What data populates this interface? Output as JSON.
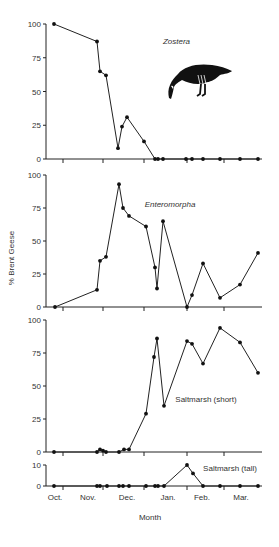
{
  "chart_data": [
    {
      "type": "line",
      "title": "Zostera",
      "title_italic": true,
      "ylabel": "% Brent Geese",
      "ylim": [
        0,
        100
      ],
      "yticks": [
        0,
        25,
        50,
        75,
        100
      ],
      "x_month_positions": [
        54,
        97,
        100,
        106,
        118,
        122,
        127,
        144,
        155,
        158,
        163,
        186,
        192,
        203,
        220,
        240,
        258
      ],
      "values": [
        100,
        87,
        65,
        62,
        8,
        24,
        31,
        13,
        0,
        0,
        0,
        0,
        0,
        0,
        0,
        0,
        0
      ]
    },
    {
      "type": "line",
      "title": "Enteromorpha",
      "title_italic": true,
      "ylim": [
        0,
        100
      ],
      "yticks": [
        0,
        25,
        50,
        75,
        100
      ],
      "x_month_positions": [
        55,
        97,
        100,
        106,
        119,
        123,
        129,
        146,
        155,
        157,
        163,
        187,
        192,
        203,
        220,
        240,
        258
      ],
      "values": [
        0,
        13,
        35,
        38,
        93,
        75,
        69,
        61,
        30,
        14,
        65,
        0,
        9,
        33,
        7,
        17,
        41
      ]
    },
    {
      "type": "line",
      "title": "Saltmarsh (short)",
      "title_italic": false,
      "ylim": [
        0,
        100
      ],
      "yticks": [
        0,
        25,
        50,
        75,
        100
      ],
      "x_month_positions": [
        54,
        97,
        100,
        103,
        106,
        119,
        124,
        129,
        146,
        154,
        157,
        164,
        187,
        192,
        203,
        220,
        240,
        258
      ],
      "values": [
        0,
        0,
        2,
        1,
        0,
        0,
        2,
        2,
        29,
        72,
        86,
        35,
        84,
        82,
        67,
        94,
        83,
        60
      ]
    },
    {
      "type": "line",
      "title": "Saltmarsh (tall)",
      "title_italic": false,
      "ylim": [
        0,
        10
      ],
      "yticks": [
        0,
        10
      ],
      "x_month_positions": [
        54,
        97,
        100,
        107,
        119,
        123,
        129,
        146,
        155,
        158,
        164,
        187,
        193,
        203,
        220,
        240,
        258
      ],
      "values": [
        0,
        0,
        0,
        0,
        0,
        0,
        0,
        0,
        0,
        0,
        0,
        10,
        6,
        0,
        0,
        0,
        0
      ]
    }
  ],
  "axes": {
    "xlabel": "Month",
    "ylabel": "% Brent Geese",
    "month_labels": [
      "Oct.",
      "Nov.",
      "Dec.",
      "Jan.",
      "Feb.",
      "Mar."
    ],
    "month_label_x": [
      55,
      88,
      127,
      168,
      202,
      241
    ],
    "month_tick_x": [
      63,
      103,
      144,
      187,
      224
    ]
  },
  "illustration": {
    "name": "brent-goose-drawing"
  }
}
